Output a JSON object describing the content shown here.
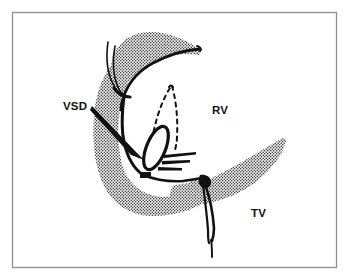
{
  "figure": {
    "type": "line-drawing",
    "background_color": "#ffffff",
    "ink_color": "#111111",
    "stipple_color": "#1a1a1a",
    "border": {
      "name": "figure-frame",
      "color": "#8d8d8d",
      "x": 12,
      "y": 12,
      "width": 325,
      "height": 256,
      "stroke_width": 1.3
    }
  },
  "labels": [
    {
      "id": "vsd",
      "text": "VSD",
      "x": 63,
      "y": 110,
      "anchor": "start",
      "description": "ventricular septal defect, with leader arrow pointing down-right to the defect orifice"
    },
    {
      "id": "rv",
      "text": "RV",
      "x": 212,
      "y": 114,
      "anchor": "start",
      "description": "right ventricle cavity"
    },
    {
      "id": "tv",
      "text": "TV",
      "x": 251,
      "y": 217,
      "anchor": "start",
      "description": "tricuspid valve leaflet"
    }
  ],
  "annotations": {
    "leader_arrow": {
      "name": "vsd-leader-arrow",
      "from_x": 92,
      "from_y": 108,
      "to_x": 142,
      "to_y": 159,
      "style": "solid tapered wedge arrow"
    },
    "defect_orifice": {
      "name": "vsd-orifice-ellipse",
      "cx": 156,
      "cy": 148,
      "rx": 9,
      "ry": 23,
      "rotation_deg": 22,
      "style": "solid heavy outline ellipse"
    },
    "hidden_outline": {
      "name": "dashed-hidden-outline",
      "style": "dashed",
      "description": "dashed projection of obscured valve tissue rising above the defect"
    },
    "spikes": {
      "name": "chordal-spikes",
      "count": 3,
      "description": "three tapered dark spikes fanning rightward from the defect rim"
    },
    "septal_marker": {
      "name": "septal-marker-block",
      "x": 140,
      "y": 172,
      "width": 11,
      "height": 6,
      "style": "solid filled block on the septal crest"
    }
  },
  "structures": [
    {
      "id": "upper-leaflet",
      "name": "upper-stippled-leaflet",
      "fill": "stipple",
      "description": "superior leaflet band running from upper-left down-right to a pointed tip"
    },
    {
      "id": "septum",
      "name": "septal-stippled-mass",
      "fill": "stipple",
      "description": "curved interventricular septal band along the left descending to a rounded inferior border"
    },
    {
      "id": "tv-leaflet",
      "name": "tricuspid-leaflet-stippled-wedge",
      "fill": "stipple",
      "description": "right-hand wedge shaped tricuspid leaflet with pointed superior tip"
    },
    {
      "id": "chordae-left",
      "name": "left-chordae-lines",
      "fill": "none",
      "description": "two thin curved chordae converging to a thickened papillary attachment"
    },
    {
      "id": "chordae-right",
      "name": "right-chordae-line",
      "fill": "none",
      "description": "thick chordal knot with elongated loop descending below the valve"
    }
  ]
}
